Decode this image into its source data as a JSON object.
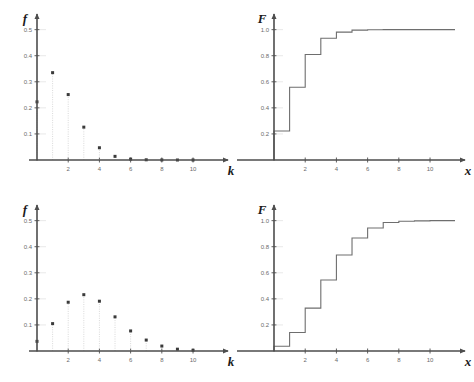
{
  "figure": {
    "background": "#ffffff",
    "axis_color": "#4d4d4d",
    "marker_color": "#3a3a3a",
    "stem_color": "#cfcfcf",
    "step_color": "#6e6e6e",
    "tick_color": "#6b6b6b"
  },
  "panels": [
    {
      "id": "top-left",
      "position": "top-left",
      "ylabel": "f",
      "xlabel": "k",
      "yticks": [
        "0.1",
        "0.2",
        "0.3",
        "0.4",
        "0.5"
      ],
      "ytick_values": [
        0.1,
        0.2,
        0.3,
        0.4,
        0.5
      ],
      "xticks": [
        "2",
        "4",
        "6",
        "8",
        "10"
      ],
      "xtick_values": [
        2,
        4,
        6,
        8,
        10
      ],
      "chart_data": {
        "type": "scatter",
        "title": "",
        "xlabel": "k",
        "ylabel": "f",
        "xlim": [
          0,
          11.6
        ],
        "ylim": [
          0,
          0.56
        ],
        "grid": false,
        "legend": "none",
        "stems": true,
        "x": [
          0,
          1,
          2,
          3,
          4,
          5,
          6,
          7,
          8,
          9,
          10
        ],
        "values": [
          0.223,
          0.335,
          0.251,
          0.126,
          0.047,
          0.014,
          0.0035,
          0.0008,
          0.0002,
          0.0,
          0.0
        ]
      }
    },
    {
      "id": "top-right",
      "position": "top-right",
      "ylabel": "F",
      "xlabel": "x",
      "yticks": [
        "0.2",
        "0.4",
        "0.6",
        "0.8",
        "1.0"
      ],
      "ytick_values": [
        0.2,
        0.4,
        0.6,
        0.8,
        1.0
      ],
      "xticks": [
        "2",
        "4",
        "6",
        "8",
        "10"
      ],
      "xtick_values": [
        2,
        4,
        6,
        8,
        10
      ],
      "chart_data": {
        "type": "line",
        "title": "",
        "xlabel": "x",
        "ylabel": "F",
        "xlim": [
          0,
          11.6
        ],
        "ylim": [
          0,
          1.12
        ],
        "grid": false,
        "legend": "none",
        "step": "post",
        "x": [
          0,
          1,
          2,
          3,
          4,
          5,
          6,
          7,
          8,
          9,
          10,
          11
        ],
        "values": [
          0.223,
          0.558,
          0.809,
          0.934,
          0.981,
          0.996,
          0.999,
          1.0,
          1.0,
          1.0,
          1.0,
          1.0
        ]
      }
    },
    {
      "id": "bottom-left",
      "position": "bottom-left",
      "ylabel": "f",
      "xlabel": "k",
      "yticks": [
        "0.1",
        "0.2",
        "0.3",
        "0.4",
        "0.5"
      ],
      "ytick_values": [
        0.1,
        0.2,
        0.3,
        0.4,
        0.5
      ],
      "xticks": [
        "2",
        "4",
        "6",
        "8",
        "10"
      ],
      "xtick_values": [
        2,
        4,
        6,
        8,
        10
      ],
      "chart_data": {
        "type": "scatter",
        "title": "",
        "xlabel": "k",
        "ylabel": "f",
        "xlim": [
          0,
          11.6
        ],
        "ylim": [
          0,
          0.56
        ],
        "grid": false,
        "legend": "none",
        "stems": true,
        "x": [
          0,
          1,
          2,
          3,
          4,
          5,
          6,
          7,
          8,
          9,
          10
        ],
        "values": [
          0.037,
          0.105,
          0.187,
          0.216,
          0.191,
          0.131,
          0.077,
          0.042,
          0.019,
          0.007,
          0.003
        ]
      }
    },
    {
      "id": "bottom-right",
      "position": "bottom-right",
      "ylabel": "F",
      "xlabel": "x",
      "yticks": [
        "0.2",
        "0.4",
        "0.6",
        "0.8",
        "1.0"
      ],
      "ytick_values": [
        0.2,
        0.4,
        0.6,
        0.8,
        1.0
      ],
      "xticks": [
        "2",
        "4",
        "6",
        "8",
        "10"
      ],
      "xtick_values": [
        2,
        4,
        6,
        8,
        10
      ],
      "chart_data": {
        "type": "line",
        "title": "",
        "xlabel": "x",
        "ylabel": "F",
        "xlim": [
          0,
          11.6
        ],
        "ylim": [
          0,
          1.12
        ],
        "grid": false,
        "legend": "none",
        "step": "post",
        "x": [
          0,
          1,
          2,
          3,
          4,
          5,
          6,
          7,
          8,
          9,
          10,
          11
        ],
        "values": [
          0.037,
          0.142,
          0.329,
          0.545,
          0.736,
          0.867,
          0.944,
          0.986,
          0.995,
          0.998,
          1.0,
          1.0
        ]
      }
    }
  ]
}
